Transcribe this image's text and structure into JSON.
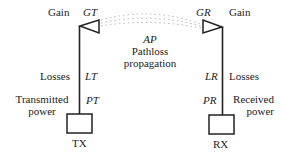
{
  "diagram": {
    "transmitter": {
      "gain_label": "Gain",
      "gain_symbol": "GT",
      "losses_label": "Losses",
      "losses_symbol": "LT",
      "power_label_line1": "Transmitted",
      "power_label_line2": "power",
      "power_symbol": "PT",
      "box_label": "TX"
    },
    "receiver": {
      "gain_label": "Gain",
      "gain_symbol": "GR",
      "losses_label": "Losses",
      "losses_symbol": "LR",
      "power_label_line1": "Received",
      "power_label_line2": "power",
      "power_symbol": "PR",
      "box_label": "RX"
    },
    "propagation": {
      "symbol": "AP",
      "label_line1": "Pathloss",
      "label_line2": "propagation"
    },
    "colors": {
      "stroke": "#222222",
      "dotted": "#b0b0b0",
      "background": "#ffffff"
    }
  }
}
